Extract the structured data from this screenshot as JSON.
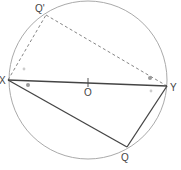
{
  "diagram": {
    "type": "circle-geometry",
    "circle": {
      "center_label": "O",
      "cx": 88,
      "cy": 80,
      "r": 79
    },
    "points": {
      "X": {
        "label": "X",
        "x": 8,
        "y": 80
      },
      "Y": {
        "label": "Y",
        "x": 167,
        "y": 86
      },
      "Q": {
        "label": "Q",
        "x": 127,
        "y": 147
      },
      "Q_prime": {
        "label": "Q'",
        "x": 46,
        "y": 15
      },
      "O": {
        "label": "O",
        "x": 88,
        "y": 82
      }
    },
    "segments": [
      {
        "from": "X",
        "to": "Y",
        "style": "solid-thick",
        "note": "diameter XY"
      },
      {
        "from": "X",
        "to": "Q",
        "style": "solid"
      },
      {
        "from": "Q",
        "to": "Y",
        "style": "solid"
      },
      {
        "from": "X",
        "to": "Q_prime",
        "style": "dashed"
      },
      {
        "from": "Q_prime",
        "to": "Y",
        "style": "dashed"
      }
    ],
    "angle_markers": [
      {
        "near": "X",
        "kind": "dot",
        "x": 28,
        "y": 85
      },
      {
        "near": "Y",
        "kind": "dot",
        "x": 150,
        "y": 78
      },
      {
        "near": "X",
        "kind": "faint",
        "x": 24,
        "y": 69
      },
      {
        "near": "Y",
        "kind": "faint",
        "x": 151,
        "y": 91
      }
    ],
    "colors": {
      "circle": "#aaaaaa",
      "solid_line": "#444444",
      "dashed_line": "#777777",
      "marker": "#999999",
      "label": "#444444"
    }
  }
}
